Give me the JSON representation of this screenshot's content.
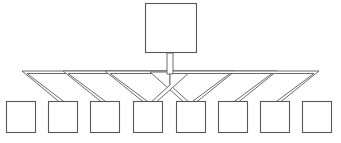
{
  "diagram": {
    "type": "network-topology",
    "background_color": "#ffffff",
    "node_stroke_color": "#58585a",
    "link_stroke_color": "#6a6a6c",
    "node_fill_color": "#ffffff",
    "hub": {
      "label": "",
      "name": "hub-node",
      "x": 145,
      "y": 3,
      "width": 51,
      "height": 50
    },
    "stem": {
      "name": "hub-stem",
      "x_center": 170,
      "y_top": 53,
      "y_bottom": 77,
      "width": 6
    },
    "bus": {
      "name": "horizontal-bus",
      "y_top": 71,
      "y_bottom": 75,
      "x_left": 22,
      "x_right": 319,
      "x_center": 170
    },
    "leaf_count": 8,
    "leaf_geometry": {
      "y_top": 101,
      "height": 32,
      "width": 29
    },
    "leaves": [
      {
        "name": "leaf-node-1",
        "label": "",
        "x": 6,
        "attach_side": "right"
      },
      {
        "name": "leaf-node-2",
        "label": "",
        "x": 48,
        "attach_side": "right"
      },
      {
        "name": "leaf-node-3",
        "label": "",
        "x": 90,
        "attach_side": "right"
      },
      {
        "name": "leaf-node-4",
        "label": "",
        "x": 133,
        "attach_side": "right"
      },
      {
        "name": "leaf-node-5",
        "label": "",
        "x": 176,
        "attach_side": "left"
      },
      {
        "name": "leaf-node-6",
        "label": "",
        "x": 218,
        "attach_side": "left"
      },
      {
        "name": "leaf-node-7",
        "label": "",
        "x": 260,
        "attach_side": "left"
      },
      {
        "name": "leaf-node-8",
        "label": "",
        "x": 302,
        "attach_side": "left"
      }
    ],
    "links": [
      {
        "name": "link-hub-to-leaf-1",
        "from": "hub",
        "to": "leaf-node-1",
        "bus_x": 22,
        "drop_x": 36
      },
      {
        "name": "link-hub-to-leaf-2",
        "from": "hub",
        "to": "leaf-node-2",
        "bus_x": 63,
        "drop_x": 78
      },
      {
        "name": "link-hub-to-leaf-3",
        "from": "hub",
        "to": "leaf-node-3",
        "bus_x": 105,
        "drop_x": 120
      },
      {
        "name": "link-hub-to-leaf-4",
        "from": "hub",
        "to": "leaf-node-4",
        "bus_x": 147,
        "drop_x": 162
      },
      {
        "name": "link-hub-to-leaf-5",
        "from": "hub",
        "to": "leaf-node-5",
        "bus_x": 194,
        "drop_x": 179
      },
      {
        "name": "link-hub-to-leaf-6",
        "from": "hub",
        "to": "leaf-node-6",
        "bus_x": 236,
        "drop_x": 221
      },
      {
        "name": "link-hub-to-leaf-7",
        "from": "hub",
        "to": "leaf-node-7",
        "bus_x": 278,
        "drop_x": 263
      },
      {
        "name": "link-hub-to-leaf-8",
        "from": "hub",
        "to": "leaf-node-8",
        "bus_x": 319,
        "drop_x": 305
      }
    ]
  }
}
